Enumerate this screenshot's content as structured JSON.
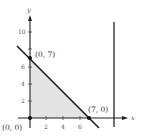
{
  "diagram": {
    "type": "feasible-region-plot",
    "axes": {
      "x_label": "x",
      "y_label": "y",
      "x_ticks": [
        "2",
        "4",
        "6"
      ],
      "y_ticks": [
        "2",
        "4",
        "6",
        "10"
      ]
    },
    "points": [
      {
        "label": "(0, 0)",
        "x": 0,
        "y": 0
      },
      {
        "label": "(0, 7)",
        "x": 0,
        "y": 7
      },
      {
        "label": "(7, 0)",
        "x": 7,
        "y": 0
      }
    ],
    "lines": [
      {
        "description": "x + y = 7",
        "from": [
          -1.5,
          8.5
        ],
        "to": [
          8,
          -1
        ]
      },
      {
        "description": "vertical line",
        "x": 10
      }
    ],
    "region": {
      "fill": "#e6e6e6",
      "vertices": [
        [
          0,
          0
        ],
        [
          0,
          7
        ],
        [
          7,
          0
        ]
      ]
    }
  }
}
